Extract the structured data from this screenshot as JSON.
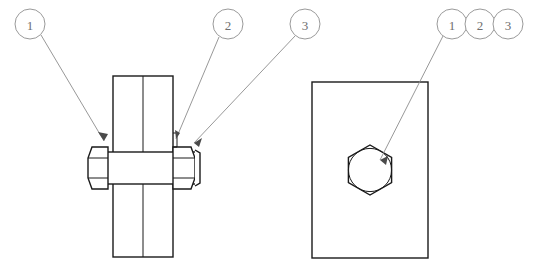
{
  "drawing": {
    "title": "Bolted joint assembly drawing",
    "background_color": "#ffffff",
    "line_color": "#1a1a1a",
    "leader_color": "#8c8c8c",
    "balloon_text_color": "#6e6e6e",
    "hatch_color": "#3a3a3a"
  },
  "balloons": {
    "left_group": [
      {
        "id": "balloon-1",
        "label": "1",
        "cx": 30,
        "cy": 24,
        "r": 15
      },
      {
        "id": "balloon-2",
        "label": "2",
        "cx": 228,
        "cy": 24,
        "r": 15
      },
      {
        "id": "balloon-3",
        "label": "3",
        "cx": 305,
        "cy": 24,
        "r": 15
      }
    ],
    "right_group": [
      {
        "id": "balloon-r1",
        "label": "1",
        "cx": 452,
        "cy": 24,
        "r": 15
      },
      {
        "id": "balloon-r2",
        "label": "2",
        "cx": 480,
        "cy": 24,
        "r": 15
      },
      {
        "id": "balloon-r3",
        "label": "3",
        "cx": 508,
        "cy": 24,
        "r": 15
      }
    ]
  },
  "leaders": [
    {
      "id": "leader-1",
      "from_balloon": "1",
      "points": "41,35 104,141",
      "arrow_at": [
        104,
        141
      ],
      "arrow_angle": 59
    },
    {
      "id": "leader-2",
      "from_balloon": "2",
      "points": "220,37 176,139",
      "arrow_at": [
        176,
        139
      ],
      "arrow_angle": 247
    },
    {
      "id": "leader-3",
      "from_balloon": "3",
      "points": "295,35 194,143",
      "arrow_at": [
        194,
        143
      ],
      "arrow_angle": 227
    },
    {
      "id": "leader-r1",
      "from_balloon": "r1",
      "points": "443,36 380,160",
      "arrow_at": [
        380,
        160
      ],
      "arrow_angle": 243
    }
  ],
  "section_view": {
    "name": "sectioned-front-view",
    "plates": [
      {
        "id": "plate-left",
        "x": 113,
        "y": 76,
        "width": 30,
        "height": 181,
        "hatch_direction": "down-right"
      },
      {
        "id": "plate-right",
        "x": 143,
        "y": 76,
        "width": 30,
        "height": 181,
        "hatch_direction": "down-left"
      }
    ],
    "bolt_shank": {
      "x": 104,
      "y": 152,
      "width": 96,
      "height": 32
    },
    "bolt_head": {
      "x": 88,
      "y": 141,
      "width": 20,
      "height": 54
    },
    "nut": {
      "x": 173,
      "y": 141,
      "width": 22,
      "height": 54
    },
    "washer": {
      "x": 195,
      "y": 147,
      "width": 6,
      "height": 42
    }
  },
  "side_view": {
    "name": "end-view",
    "plate_rect": {
      "x": 312,
      "y": 82,
      "width": 116,
      "height": 176
    },
    "hex_nut": {
      "cx": 370,
      "cy": 170,
      "radius_across_corners": 25
    },
    "bolt_circle": {
      "cx": 370,
      "cy": 170,
      "radius": 22
    }
  }
}
